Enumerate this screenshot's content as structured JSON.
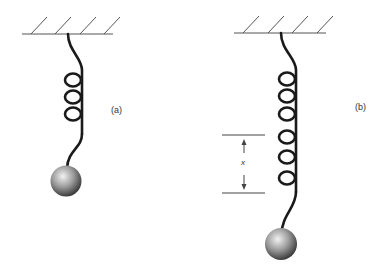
{
  "figure": {
    "panels": [
      {
        "id": "a",
        "label": "(a)",
        "coils": 3,
        "description": "spring with mass at rest"
      },
      {
        "id": "b",
        "label": "(b)",
        "coils": 6,
        "description": "spring stretched by displacement x"
      }
    ],
    "displacement_label": "x",
    "colors": {
      "stroke": "#222222",
      "ceiling": "#555555",
      "mass_light": "#e8e8e8",
      "mass_dark": "#3a3a3a"
    }
  }
}
